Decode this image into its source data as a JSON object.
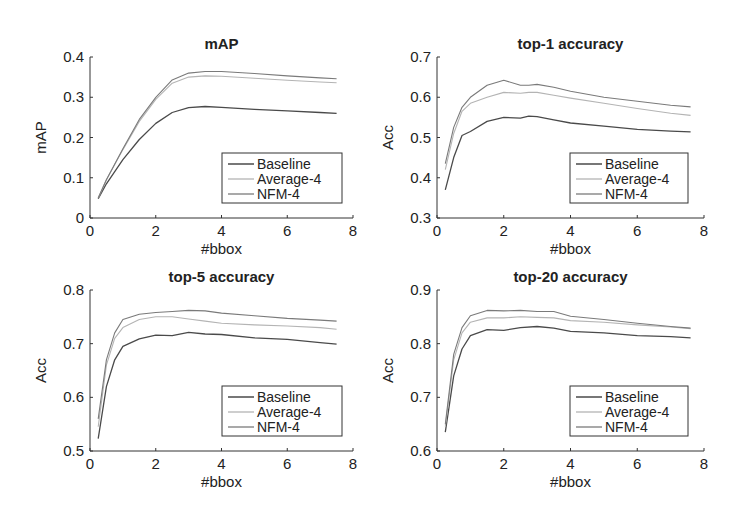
{
  "figure": {
    "width": 744,
    "height": 519,
    "background": "#ffffff"
  },
  "series_styles": {
    "Baseline": {
      "color": "#4a4a4a",
      "width": 1.3
    },
    "Average-4": {
      "color": "#b4b4b4",
      "width": 1.1
    },
    "NFM-4": {
      "color": "#7a7a7a",
      "width": 1.1
    }
  },
  "chart_data": [
    {
      "type": "line",
      "title": "mAP",
      "xlabel": "#bbox",
      "ylabel": "mAP",
      "xlim": [
        0,
        8
      ],
      "ylim": [
        0,
        0.4
      ],
      "xticks": [
        0,
        2,
        4,
        6,
        8
      ],
      "yticks": [
        0,
        0.1,
        0.2,
        0.3,
        0.4
      ],
      "ytick_labels": [
        "0",
        "0.1",
        "0.2",
        "0.3",
        "0.4"
      ],
      "grid": false,
      "legend_position": "lower right",
      "legend": [
        "Baseline",
        "Average-4",
        "NFM-4"
      ],
      "x": [
        0.25,
        0.5,
        1.0,
        1.5,
        2.0,
        2.5,
        3.0,
        3.5,
        4.0,
        5.0,
        6.0,
        7.0,
        7.5
      ],
      "series": [
        {
          "name": "Baseline",
          "values": [
            0.048,
            0.085,
            0.145,
            0.195,
            0.235,
            0.262,
            0.274,
            0.277,
            0.275,
            0.27,
            0.266,
            0.262,
            0.26
          ]
        },
        {
          "name": "Average-4",
          "values": [
            0.05,
            0.095,
            0.17,
            0.24,
            0.295,
            0.335,
            0.35,
            0.353,
            0.352,
            0.347,
            0.342,
            0.338,
            0.336
          ]
        },
        {
          "name": "NFM-4",
          "values": [
            0.05,
            0.095,
            0.172,
            0.245,
            0.3,
            0.343,
            0.36,
            0.364,
            0.364,
            0.359,
            0.353,
            0.348,
            0.346
          ]
        }
      ]
    },
    {
      "type": "line",
      "title": "top-1 accuracy",
      "xlabel": "#bbox",
      "ylabel": "Acc",
      "xlim": [
        0,
        8
      ],
      "ylim": [
        0.3,
        0.7
      ],
      "xticks": [
        0,
        2,
        4,
        6,
        8
      ],
      "yticks": [
        0.3,
        0.4,
        0.5,
        0.6,
        0.7
      ],
      "ytick_labels": [
        "0.3",
        "0.4",
        "0.5",
        "0.6",
        "0.7"
      ],
      "grid": false,
      "legend_position": "lower right",
      "legend": [
        "Baseline",
        "Average-4",
        "NFM-4"
      ],
      "x": [
        0.25,
        0.5,
        0.75,
        1.0,
        1.5,
        2.0,
        2.5,
        2.75,
        3.0,
        3.5,
        4.0,
        5.0,
        6.0,
        7.0,
        7.6
      ],
      "series": [
        {
          "name": "Baseline",
          "values": [
            0.37,
            0.45,
            0.505,
            0.515,
            0.54,
            0.55,
            0.548,
            0.553,
            0.552,
            0.544,
            0.536,
            0.528,
            0.52,
            0.516,
            0.514
          ]
        },
        {
          "name": "Average-4",
          "values": [
            0.42,
            0.51,
            0.565,
            0.585,
            0.6,
            0.612,
            0.61,
            0.612,
            0.612,
            0.605,
            0.598,
            0.585,
            0.572,
            0.56,
            0.555
          ]
        },
        {
          "name": "NFM-4",
          "values": [
            0.435,
            0.525,
            0.575,
            0.6,
            0.63,
            0.642,
            0.63,
            0.63,
            0.632,
            0.625,
            0.615,
            0.6,
            0.59,
            0.58,
            0.576
          ]
        }
      ]
    },
    {
      "type": "line",
      "title": "top-5 accuracy",
      "xlabel": "#bbox",
      "ylabel": "Acc",
      "xlim": [
        0,
        8
      ],
      "ylim": [
        0.5,
        0.8
      ],
      "xticks": [
        0,
        2,
        4,
        6,
        8
      ],
      "yticks": [
        0.5,
        0.6,
        0.7,
        0.8
      ],
      "ytick_labels": [
        "0.5",
        "0.6",
        "0.7",
        "0.8"
      ],
      "grid": false,
      "legend_position": "lower right",
      "legend": [
        "Baseline",
        "Average-4",
        "NFM-4"
      ],
      "x": [
        0.25,
        0.5,
        0.75,
        1.0,
        1.5,
        2.0,
        2.5,
        3.0,
        3.5,
        4.0,
        5.0,
        6.0,
        7.0,
        7.5
      ],
      "series": [
        {
          "name": "Baseline",
          "values": [
            0.523,
            0.62,
            0.67,
            0.695,
            0.709,
            0.716,
            0.715,
            0.721,
            0.718,
            0.717,
            0.711,
            0.708,
            0.702,
            0.699
          ]
        },
        {
          "name": "Average-4",
          "values": [
            0.545,
            0.66,
            0.71,
            0.73,
            0.745,
            0.75,
            0.75,
            0.746,
            0.742,
            0.738,
            0.735,
            0.733,
            0.73,
            0.727
          ]
        },
        {
          "name": "NFM-4",
          "values": [
            0.56,
            0.67,
            0.72,
            0.745,
            0.755,
            0.758,
            0.76,
            0.762,
            0.761,
            0.757,
            0.752,
            0.747,
            0.744,
            0.742
          ]
        }
      ]
    },
    {
      "type": "line",
      "title": "top-20 accuracy",
      "xlabel": "#bbox",
      "ylabel": "Acc",
      "xlim": [
        0,
        8
      ],
      "ylim": [
        0.6,
        0.9
      ],
      "xticks": [
        0,
        2,
        4,
        6,
        8
      ],
      "yticks": [
        0.6,
        0.7,
        0.8,
        0.9
      ],
      "ytick_labels": [
        "0.6",
        "0.7",
        "0.8",
        "0.9"
      ],
      "grid": false,
      "legend_position": "lower right",
      "legend": [
        "Baseline",
        "Average-4",
        "NFM-4"
      ],
      "x": [
        0.25,
        0.5,
        0.75,
        1.0,
        1.5,
        2.0,
        2.5,
        3.0,
        3.5,
        4.0,
        5.0,
        6.0,
        7.0,
        7.6
      ],
      "series": [
        {
          "name": "Baseline",
          "values": [
            0.635,
            0.74,
            0.79,
            0.815,
            0.826,
            0.825,
            0.83,
            0.832,
            0.829,
            0.823,
            0.82,
            0.815,
            0.813,
            0.811
          ]
        },
        {
          "name": "Average-4",
          "values": [
            0.645,
            0.77,
            0.82,
            0.84,
            0.848,
            0.848,
            0.85,
            0.849,
            0.848,
            0.843,
            0.84,
            0.835,
            0.831,
            0.828
          ]
        },
        {
          "name": "NFM-4",
          "values": [
            0.65,
            0.78,
            0.83,
            0.852,
            0.862,
            0.861,
            0.862,
            0.86,
            0.86,
            0.851,
            0.845,
            0.838,
            0.832,
            0.829
          ]
        }
      ]
    }
  ]
}
